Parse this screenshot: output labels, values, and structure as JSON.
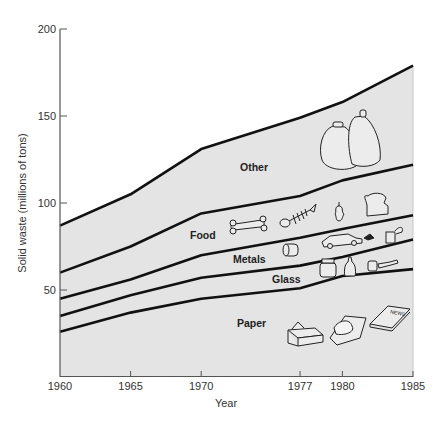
{
  "chart_data": {
    "type": "area",
    "stacked": true,
    "title": "",
    "xlabel": "Year",
    "ylabel": "Solid waste (millions of tons)",
    "x": [
      1960,
      1965,
      1970,
      1977,
      1980,
      1985
    ],
    "x_tick_labels": [
      "1960",
      "1965",
      "1970",
      "1977",
      "1980",
      "1985"
    ],
    "y_tick_labels": [
      "50",
      "100",
      "150",
      "200"
    ],
    "y_ticks": [
      50,
      100,
      150,
      200
    ],
    "ylim": [
      0,
      200
    ],
    "xlim": [
      1960,
      1985
    ],
    "grid": false,
    "legend": "inline band labels",
    "cumulative_boundaries": [
      {
        "name": "Paper",
        "values": [
          26,
          37,
          45,
          51,
          58,
          62
        ]
      },
      {
        "name": "Glass",
        "values": [
          35,
          47,
          57,
          64,
          69,
          79
        ]
      },
      {
        "name": "Metals",
        "values": [
          45,
          56,
          70,
          80,
          85,
          93
        ]
      },
      {
        "name": "Food",
        "values": [
          60,
          75,
          94,
          104,
          113,
          122
        ]
      },
      {
        "name": "Other",
        "values": [
          87,
          105,
          131,
          149,
          158,
          179
        ]
      }
    ],
    "series": [
      {
        "name": "Paper",
        "values": [
          26,
          37,
          45,
          51,
          58,
          62
        ]
      },
      {
        "name": "Glass",
        "values": [
          9,
          10,
          12,
          13,
          11,
          17
        ]
      },
      {
        "name": "Metals",
        "values": [
          10,
          9,
          13,
          16,
          16,
          14
        ]
      },
      {
        "name": "Food",
        "values": [
          15,
          19,
          24,
          24,
          28,
          29
        ]
      },
      {
        "name": "Other",
        "values": [
          27,
          30,
          37,
          45,
          45,
          57
        ]
      }
    ],
    "annotations": [
      "Other",
      "Food",
      "Metals",
      "Glass",
      "Paper"
    ],
    "illustrations": {
      "Other": [
        "trash-bags"
      ],
      "Food": [
        "bone",
        "fish-skeleton",
        "apple-core",
        "bread-slice"
      ],
      "Metals": [
        "tin-can",
        "car",
        "open-can"
      ],
      "Glass": [
        "jar",
        "bottle",
        "small-jar",
        "broken-bottle"
      ],
      "Paper": [
        "cardboard-box",
        "crumpled-paper",
        "newspaper"
      ]
    },
    "colors": {
      "fill": "#e4e4e4",
      "line": "#111111",
      "axis": "#555555"
    }
  },
  "labels": {
    "other": "Other",
    "food": "Food",
    "metals": "Metals",
    "glass": "Glass",
    "paper": "Paper",
    "news": "NEWS"
  }
}
